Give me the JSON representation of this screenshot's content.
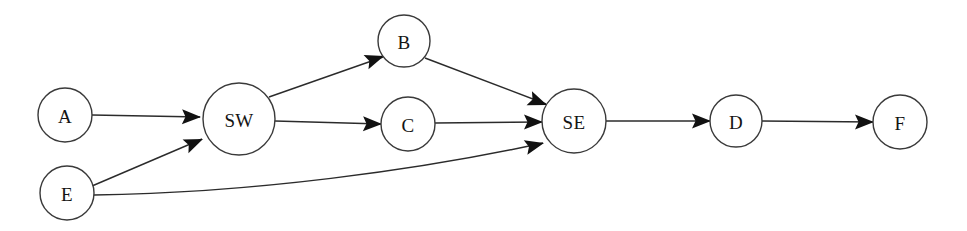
{
  "diagram": {
    "background_color": "#ffffff",
    "node_fill": "#ffffff",
    "node_stroke": "#3a3a3a",
    "edge_color": "#2b2b2b",
    "arrowhead_color": "#111111",
    "nodes": [
      {
        "id": "A",
        "label": "A",
        "cx": 65,
        "cy": 115,
        "r": 27
      },
      {
        "id": "E",
        "label": "E",
        "cx": 67,
        "cy": 193,
        "r": 27
      },
      {
        "id": "SW",
        "label": "SW",
        "cx": 239,
        "cy": 119,
        "r": 36
      },
      {
        "id": "B",
        "label": "B",
        "cx": 404,
        "cy": 41,
        "r": 26
      },
      {
        "id": "C",
        "label": "C",
        "cx": 408,
        "cy": 124,
        "r": 27
      },
      {
        "id": "SE",
        "label": "SE",
        "cx": 574,
        "cy": 121,
        "r": 32
      },
      {
        "id": "D",
        "label": "D",
        "cx": 736,
        "cy": 121,
        "r": 26
      },
      {
        "id": "F",
        "label": "F",
        "cx": 900,
        "cy": 122,
        "r": 27
      }
    ],
    "edges": [
      {
        "id": "a-sw",
        "from": "A",
        "to": "SW",
        "shape": "line",
        "path": "M 92,115 L 200,117"
      },
      {
        "id": "e-sw",
        "from": "E",
        "to": "SW",
        "shape": "line",
        "path": "M 92,186 L 202,139"
      },
      {
        "id": "e-se",
        "from": "E",
        "to": "SE",
        "shape": "curve",
        "path": "M 94,195 C 250,193 420,170 543,143"
      },
      {
        "id": "sw-b",
        "from": "SW",
        "to": "B",
        "shape": "line",
        "path": "M 269,97 L 383,57"
      },
      {
        "id": "sw-c",
        "from": "SW",
        "to": "C",
        "shape": "line",
        "path": "M 275,121 L 381,124"
      },
      {
        "id": "b-se",
        "from": "B",
        "to": "SE",
        "shape": "line",
        "path": "M 425,58 L 546,104"
      },
      {
        "id": "c-se",
        "from": "C",
        "to": "SE",
        "shape": "line",
        "path": "M 435,123 L 542,122"
      },
      {
        "id": "se-d",
        "from": "SE",
        "to": "D",
        "shape": "line",
        "path": "M 606,121 L 710,121"
      },
      {
        "id": "d-f",
        "from": "D",
        "to": "F",
        "shape": "line",
        "path": "M 762,121 L 873,122"
      }
    ],
    "arrowheads": [
      {
        "id": "head-a-sw",
        "edge": "a-sw",
        "x": 201,
        "y": 117,
        "angle": 1
      },
      {
        "id": "head-e-sw",
        "edge": "e-sw",
        "x": 203,
        "y": 139,
        "angle": -23
      },
      {
        "id": "head-e-se",
        "edge": "e-se",
        "x": 544,
        "y": 143,
        "angle": -14
      },
      {
        "id": "head-sw-b",
        "edge": "sw-b",
        "x": 384,
        "y": 56,
        "angle": -19
      },
      {
        "id": "head-sw-c",
        "edge": "sw-c",
        "x": 382,
        "y": 124,
        "angle": 1
      },
      {
        "id": "head-b-se",
        "edge": "b-se",
        "x": 547,
        "y": 105,
        "angle": 21
      },
      {
        "id": "head-c-se",
        "edge": "c-se",
        "x": 543,
        "y": 122,
        "angle": 0
      },
      {
        "id": "head-se-d",
        "edge": "se-d",
        "x": 711,
        "y": 121,
        "angle": 0
      },
      {
        "id": "head-d-f",
        "edge": "d-f",
        "x": 874,
        "y": 122,
        "angle": 0
      }
    ]
  }
}
